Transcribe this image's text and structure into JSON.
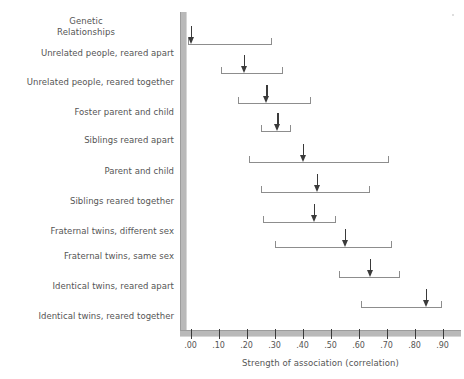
{
  "chart_data": {
    "type": "bar",
    "title": "",
    "xlabel": "Strength of association (correlation)",
    "ylabel": "Genetic Relationships",
    "xlim": [
      -0.05,
      0.98
    ],
    "grid": false,
    "legend": "none",
    "tick_labels": [
      ".00",
      ".10",
      ".20",
      ".30",
      ".40",
      ".50",
      ".60",
      ".70",
      ".80",
      ".90"
    ],
    "tick_values": [
      0.0,
      0.1,
      0.2,
      0.3,
      0.4,
      0.5,
      0.6,
      0.7,
      0.8,
      0.9
    ],
    "categories": [
      "Unrelated people, reared apart",
      "Unrelated people, reared together",
      "Foster parent and child",
      "Siblings reared apart",
      "Parent and child",
      "Siblings reared together",
      "Fraternal twins, different sex",
      "Fraternal twins, same sex",
      "Identical twins, reared apart",
      "Identical twins, reared together"
    ],
    "series": [
      {
        "name": "Range of correlations",
        "ranges": [
          [
            -0.01,
            0.29
          ],
          [
            0.11,
            0.33
          ],
          [
            0.17,
            0.43
          ],
          [
            0.25,
            0.36
          ],
          [
            0.21,
            0.71
          ],
          [
            0.25,
            0.64
          ],
          [
            0.26,
            0.52
          ],
          [
            0.3,
            0.72
          ],
          [
            0.53,
            0.75
          ],
          [
            0.61,
            0.9
          ]
        ]
      },
      {
        "name": "Median correlation",
        "values": [
          0.0,
          0.19,
          0.27,
          0.31,
          0.4,
          0.45,
          0.44,
          0.55,
          0.64,
          0.84
        ]
      }
    ]
  },
  "header": {
    "line1": "Genetic",
    "line2": "Relationships"
  },
  "colors": {
    "axis_bar": "#b9b9b9",
    "bracket": "#8d8d8d",
    "arrow": "#3a3a3a",
    "text": "#555555",
    "background": "#ffffff"
  }
}
